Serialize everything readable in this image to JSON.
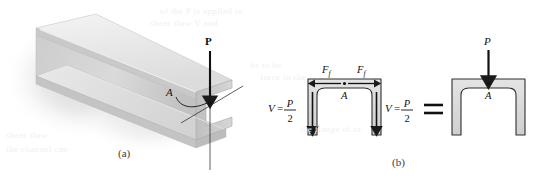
{
  "figure": {
    "caption_a": "(a)",
    "caption_b": "(b)",
    "panel_a": {
      "load_label": "P",
      "point_label": "A",
      "description": "channel-beam-3d-perspective"
    },
    "panel_b": {
      "free_body": {
        "point_label": "A",
        "friction_left_label": "F",
        "friction_left_sub": "f",
        "friction_right_label": "F",
        "friction_right_sub": "f",
        "shear_left": {
          "var": "V",
          "eq": "=",
          "num": "P",
          "den": "2"
        },
        "shear_right": {
          "var": "V",
          "eq": "=",
          "num": "P",
          "den": "2"
        }
      },
      "equals_sign": "=",
      "combined": {
        "load_label": "P",
        "point_label": "A"
      }
    }
  },
  "colors": {
    "page_background": "#ffffff",
    "ink": "#1a1a1a",
    "channel_fill": "#d9d9d9",
    "channel_stroke": "#3a3a3a",
    "beam_light": "#ededed",
    "beam_mid": "#cfcfcf",
    "beam_dark": "#b4b4b4",
    "shadow": "#d8d8d8",
    "bleed_text": "#f1f1f1"
  },
  "bleed_through_text": [
    "of the P is applied to",
    "shear flow V and",
    "be to be",
    "force in the",
    "shear flow",
    "the channel can",
    "the flange of to"
  ]
}
